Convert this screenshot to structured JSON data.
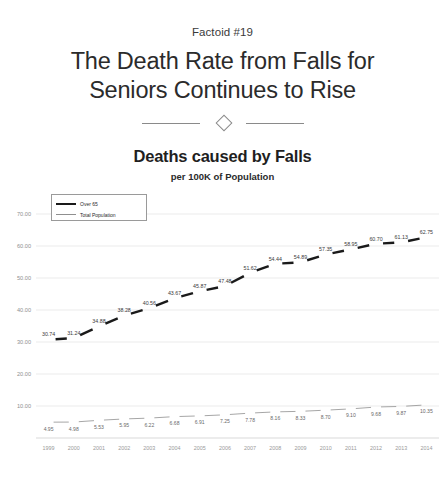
{
  "header": {
    "factoid": "Factoid #19",
    "headline_line1": "The Death Rate from Falls for",
    "headline_line2": "Seniors Continues to Rise"
  },
  "divider": {
    "icon": "diamond-divider"
  },
  "chart_data": {
    "type": "line",
    "title": "Deaths caused by Falls",
    "subtitle": "per 100K of Population",
    "xlabel": "",
    "ylabel": "",
    "ylim": [
      0,
      75
    ],
    "yticks": [
      "10.00",
      "20.00",
      "30.00",
      "40.00",
      "50.00",
      "60.00",
      "70.00"
    ],
    "ytick_values": [
      10,
      20,
      30,
      40,
      50,
      60,
      70
    ],
    "grid": true,
    "legend_position": "top-left",
    "categories": [
      "1999",
      "2000",
      "2001",
      "2002",
      "2003",
      "2004",
      "2005",
      "2006",
      "2007",
      "2008",
      "2009",
      "2010",
      "2011",
      "2012",
      "2013",
      "2014"
    ],
    "series": [
      {
        "name": "Over 65",
        "color": "#1a1a1a",
        "values": [
          30.74,
          31.24,
          34.88,
          38.28,
          40.56,
          43.67,
          45.87,
          47.48,
          51.62,
          54.44,
          54.89,
          57.35,
          58.95,
          60.7,
          61.13,
          62.75
        ],
        "labels": [
          "30.74",
          "31.24",
          "34.88",
          "38.28",
          "40.56",
          "43.67",
          "45.87",
          "47.48",
          "51.62",
          "54.44",
          "54.89",
          "57.35",
          "58.95",
          "60.70",
          "61.13",
          "62.75"
        ]
      },
      {
        "name": "Total Population",
        "color": "#8f8f8f",
        "values": [
          4.95,
          4.98,
          5.53,
          5.95,
          6.22,
          6.68,
          6.91,
          7.25,
          7.78,
          8.16,
          8.33,
          8.7,
          9.1,
          9.68,
          9.87,
          10.35
        ],
        "labels": [
          "4.95",
          "4.98",
          "5.53",
          "5.95",
          "6.22",
          "6.68",
          "6.91",
          "7.25",
          "7.78",
          "8.16",
          "8.33",
          "8.70",
          "9.10",
          "9.68",
          "9.87",
          "10.35"
        ]
      }
    ]
  },
  "legend": {
    "items": [
      {
        "label": "Over 65"
      },
      {
        "label": "Total Population"
      }
    ]
  },
  "footer": {
    "note": ""
  }
}
